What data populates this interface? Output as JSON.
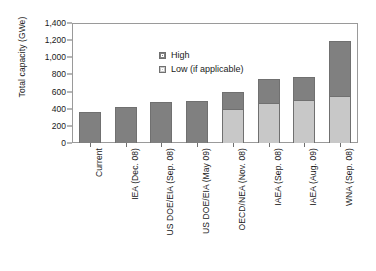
{
  "chart_data": {
    "type": "bar",
    "title": "",
    "xlabel": "",
    "ylabel": "Total capacity (GWe)",
    "ylim": [
      0,
      1400
    ],
    "yticks": [
      "0",
      "200",
      "400",
      "600",
      "800",
      "1,000",
      "1,200",
      "1,400"
    ],
    "ytick_values": [
      0,
      200,
      400,
      600,
      800,
      1000,
      1200,
      1400
    ],
    "grid": false,
    "stacked": true,
    "legend_position": "top-left",
    "categories": [
      "Current",
      "IEA (Dec. 08)",
      "US DOE/EIA (Sep. 08)",
      "US DOE/EIA (May 09)",
      "OECD/NEA (Nov. 08)",
      "IAEA (Sep. 08)",
      "IAEA (Aug. 09)",
      "WNA (Sep. 08)"
    ],
    "series": [
      {
        "name": "Low (if applicable)",
        "color": "#c8c8c8",
        "values": [
          null,
          null,
          null,
          null,
          400,
          470,
          500,
          550
        ]
      },
      {
        "name": "High",
        "color": "#808080",
        "values": [
          365,
          415,
          475,
          490,
          600,
          745,
          775,
          1195
        ]
      }
    ],
    "totals": [
      365,
      415,
      475,
      490,
      600,
      745,
      775,
      1195
    ]
  },
  "legend": {
    "items": [
      {
        "label": "High",
        "swatch": "dark-gray-swatch"
      },
      {
        "label": "Low (if applicable)",
        "swatch": "light-gray-swatch"
      }
    ]
  },
  "colors": {
    "high": "#808080",
    "low": "#c8c8c8",
    "axis": "#6f6f6f",
    "frame": "#9a9a9a",
    "background": "#ffffff",
    "text": "#1a1a1a"
  }
}
